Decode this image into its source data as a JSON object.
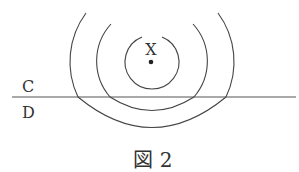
{
  "diagram": {
    "source_label": "X",
    "region_above": "C",
    "region_below": "D",
    "caption": "図 2",
    "colors": {
      "stroke": "#444444",
      "text": "#333333",
      "background": "#ffffff"
    }
  }
}
